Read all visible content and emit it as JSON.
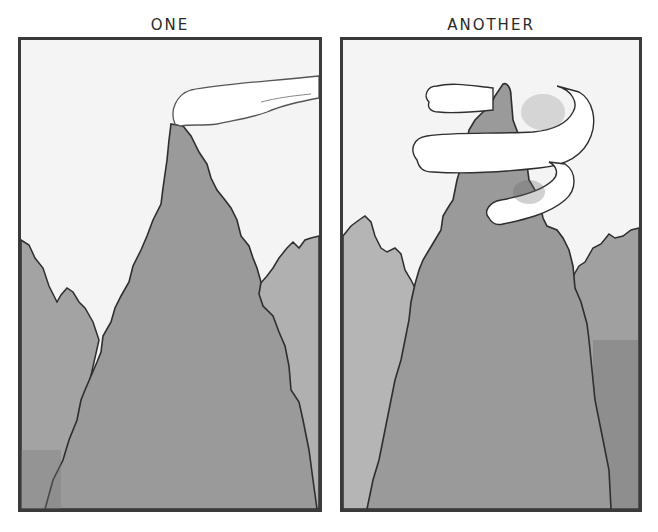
{
  "panels": [
    {
      "label": "ONE",
      "scene": "mountain peak with a single horizontal cloud trailing off the summit like a flag",
      "colors": {
        "sky": "#f4f4f4",
        "mountain": "#9a9a9a",
        "side_mountains": "#a8a8a8",
        "cloud": "#ffffff",
        "outline": "#2e2e2e"
      }
    },
    {
      "label": "ANOTHER",
      "scene": "mountain peak with a long puffy cloud spiraling around the summit",
      "colors": {
        "sky": "#f4f4f4",
        "mountain": "#9a9a9a",
        "side_mountains": "#b0b0b0",
        "cloud": "#ffffff",
        "outline": "#2e2e2e"
      }
    }
  ]
}
